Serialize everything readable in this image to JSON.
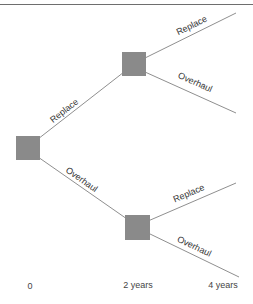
{
  "diagram": {
    "type": "decision-tree",
    "colors": {
      "node_fill": "#8a8a8a",
      "line": "#8f8f8f",
      "top_rule": "#6e6e6e",
      "text": "#333333",
      "background": "#ffffff"
    },
    "nodes": [
      {
        "id": "root",
        "shape": "square",
        "x": 16,
        "y": 136,
        "size": 24
      },
      {
        "id": "upper",
        "shape": "square",
        "x": 122,
        "y": 52,
        "size": 24
      },
      {
        "id": "lower",
        "shape": "square",
        "x": 125,
        "y": 215,
        "size": 25
      }
    ],
    "branches": [
      {
        "from": "root",
        "to": "upper",
        "label": "Replace"
      },
      {
        "from": "root",
        "to": "lower",
        "label": "Overhaul"
      },
      {
        "from": "upper",
        "to": "end-1",
        "label": "Replace"
      },
      {
        "from": "upper",
        "to": "end-2",
        "label": "Overhaul"
      },
      {
        "from": "lower",
        "to": "end-3",
        "label": "Replace"
      },
      {
        "from": "lower",
        "to": "end-4",
        "label": "Overhaul"
      }
    ],
    "timeline": [
      {
        "label": "0"
      },
      {
        "label": "2 years"
      },
      {
        "label": "4 years"
      }
    ]
  }
}
